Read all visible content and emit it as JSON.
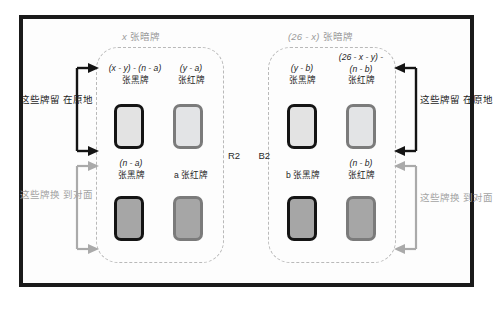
{
  "diagram": {
    "colors": {
      "frame": "#1a1a1a",
      "dashed_group": "#b9b9b9",
      "card_black_border": "#141414",
      "card_red_border": "#7b7b7b",
      "card_face_light": "#e3e3e3",
      "card_face_dark": "#a6a6a6",
      "note_dark": "#1d1d1d",
      "note_gray": "#a3a3a3"
    },
    "groups": [
      {
        "id": "left-group",
        "caption_prefix": "x",
        "caption_suffix": " 张暗牌",
        "cards": [
          {
            "id": "left-top-black",
            "label_line1": "(x - y) - (n - a)",
            "label_line2": "张黑牌",
            "suit": "black",
            "state": "face-up"
          },
          {
            "id": "left-top-red",
            "label_line1": "(y - a)",
            "label_line2": "张红牌",
            "suit": "red",
            "state": "face-up"
          },
          {
            "id": "left-bottom-black",
            "label_line1": "(n - a)",
            "label_line2": "张黑牌",
            "suit": "black",
            "state": "face-down"
          },
          {
            "id": "left-bottom-red",
            "label_line1": "",
            "label_line2": "a 张红牌",
            "suit": "red",
            "state": "face-down"
          }
        ]
      },
      {
        "id": "right-group",
        "caption_prefix": "(26 - x)",
        "caption_suffix": " 张暗牌",
        "cards": [
          {
            "id": "right-top-black",
            "label_line1": "(y - b)",
            "label_line2": "张黑牌",
            "suit": "black",
            "state": "face-up"
          },
          {
            "id": "right-top-red",
            "label_line1": "(26 - x - y) -",
            "label_line2": "(n - b)",
            "label_line3": "张红牌",
            "suit": "red",
            "state": "face-up"
          },
          {
            "id": "right-bottom-black",
            "label_line1": "",
            "label_line2": "b 张黑牌",
            "suit": "black",
            "state": "face-down"
          },
          {
            "id": "right-bottom-red",
            "label_line1": "(n - b)",
            "label_line2": "张红牌",
            "suit": "red",
            "state": "face-down"
          }
        ]
      }
    ],
    "center": {
      "left_label": "R2",
      "right_label": "B2"
    },
    "annotations": {
      "left_top_line1": "这些牌留",
      "left_top_line2": "在原地",
      "left_bottom_line1": "这些牌换",
      "left_bottom_line2": "到对面",
      "right_top_line1": "这些牌留",
      "right_top_line2": "在原地",
      "right_bottom_line1": "这些牌换",
      "right_bottom_line2": "到对面"
    }
  }
}
